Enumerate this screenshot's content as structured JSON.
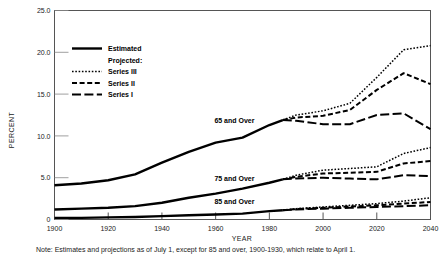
{
  "chart_data": {
    "type": "line",
    "title": "",
    "xlabel": "YEAR",
    "ylabel": "PERCENT",
    "xlim": [
      1900,
      2040
    ],
    "ylim": [
      0,
      25
    ],
    "xticks": [
      "1900",
      "1920",
      "1940",
      "1960",
      "1980",
      "2000",
      "2020",
      "2040"
    ],
    "xtick_values": [
      1900,
      1920,
      1940,
      1960,
      1980,
      2000,
      2020,
      2040
    ],
    "yticks": [
      "0",
      "5.0",
      "10.0",
      "15.0",
      "20.0",
      "25.0"
    ],
    "ytick_values": [
      0,
      5,
      10,
      15,
      20,
      25
    ],
    "grid": false,
    "legend_position": "upper-left-inside",
    "legend": [
      {
        "label": "Estimated",
        "style": "solid"
      },
      {
        "label": "Projected:",
        "style": "header"
      },
      {
        "label": "Series III",
        "style": "dotted"
      },
      {
        "label": "Series II",
        "style": "dashed"
      },
      {
        "label": "Series I",
        "style": "long-dash"
      }
    ],
    "annotations": [
      {
        "text": "65 and Over",
        "x": 1967,
        "y": 11.6
      },
      {
        "text": "75 and Over",
        "x": 1967,
        "y": 4.6
      },
      {
        "text": "85 and Over",
        "x": 1967,
        "y": 1.9
      }
    ],
    "note": "Note:  Estimates and projections as of July 1, except for 85 and  over, 1900-1930, which relate to April 1.",
    "groups": [
      {
        "name": "65 and Over",
        "estimated": {
          "x": [
            1900,
            1910,
            1920,
            1930,
            1940,
            1950,
            1960,
            1970,
            1980,
            1985
          ],
          "y": [
            4.1,
            4.3,
            4.7,
            5.4,
            6.8,
            8.1,
            9.2,
            9.8,
            11.3,
            11.9
          ]
        },
        "projections": [
          {
            "series": "Series III",
            "x": [
              1985,
              1990,
              2000,
              2010,
              2020,
              2030,
              2040
            ],
            "y": [
              11.9,
              12.5,
              13.0,
              13.9,
              17.0,
              20.3,
              20.8
            ]
          },
          {
            "series": "Series II",
            "x": [
              1985,
              1990,
              2000,
              2010,
              2020,
              2030,
              2040
            ],
            "y": [
              11.9,
              12.2,
              12.4,
              13.1,
              15.5,
              17.5,
              16.2
            ]
          },
          {
            "series": "Series I",
            "x": [
              1985,
              1990,
              2000,
              2010,
              2020,
              2030,
              2040
            ],
            "y": [
              11.9,
              11.8,
              11.4,
              11.4,
              12.5,
              12.7,
              10.8
            ]
          }
        ]
      },
      {
        "name": "75 and Over",
        "estimated": {
          "x": [
            1900,
            1910,
            1920,
            1930,
            1940,
            1950,
            1960,
            1970,
            1980,
            1985
          ],
          "y": [
            1.2,
            1.3,
            1.4,
            1.6,
            2.0,
            2.6,
            3.1,
            3.7,
            4.4,
            4.8
          ]
        },
        "projections": [
          {
            "series": "Series III",
            "x": [
              1985,
              1990,
              2000,
              2010,
              2020,
              2030,
              2040
            ],
            "y": [
              4.8,
              5.3,
              5.9,
              6.1,
              6.3,
              7.9,
              8.6
            ]
          },
          {
            "series": "Series II",
            "x": [
              1985,
              1990,
              2000,
              2010,
              2020,
              2030,
              2040
            ],
            "y": [
              4.8,
              5.1,
              5.5,
              5.6,
              5.7,
              6.7,
              7.0
            ]
          },
          {
            "series": "Series I",
            "x": [
              1985,
              1990,
              2000,
              2010,
              2020,
              2030,
              2040
            ],
            "y": [
              4.8,
              4.9,
              5.0,
              4.9,
              4.8,
              5.3,
              5.2
            ]
          }
        ]
      },
      {
        "name": "85 and Over",
        "estimated": {
          "x": [
            1900,
            1910,
            1920,
            1930,
            1940,
            1950,
            1960,
            1970,
            1980,
            1985
          ],
          "y": [
            0.2,
            0.2,
            0.25,
            0.3,
            0.4,
            0.5,
            0.6,
            0.7,
            1.0,
            1.1
          ]
        },
        "projections": [
          {
            "series": "Series III",
            "x": [
              1985,
              1990,
              2000,
              2010,
              2020,
              2030,
              2040
            ],
            "y": [
              1.1,
              1.3,
              1.5,
              1.7,
              1.9,
              2.2,
              2.6
            ]
          },
          {
            "series": "Series II",
            "x": [
              1985,
              1990,
              2000,
              2010,
              2020,
              2030,
              2040
            ],
            "y": [
              1.1,
              1.25,
              1.4,
              1.55,
              1.7,
              1.9,
              2.1
            ]
          },
          {
            "series": "Series I",
            "x": [
              1985,
              1990,
              2000,
              2010,
              2020,
              2030,
              2040
            ],
            "y": [
              1.1,
              1.2,
              1.3,
              1.4,
              1.5,
              1.6,
              1.7
            ]
          }
        ]
      }
    ]
  }
}
